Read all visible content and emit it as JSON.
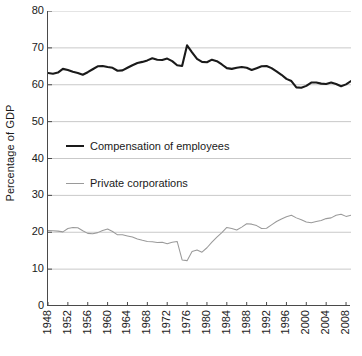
{
  "chart_data": {
    "type": "line",
    "title": "",
    "xlabel": "",
    "ylabel": "Percentage of GDP",
    "xlim": [
      1948,
      2009
    ],
    "ylim": [
      0,
      80
    ],
    "ytick_values": [
      0,
      10,
      20,
      30,
      40,
      50,
      60,
      70,
      80
    ],
    "ytick_labels": [
      "0",
      "10",
      "20",
      "30",
      "40",
      "50",
      "60",
      "70",
      "80"
    ],
    "xtick_values": [
      1948,
      1952,
      1956,
      1960,
      1964,
      1968,
      1972,
      1976,
      1980,
      1984,
      1988,
      1992,
      1996,
      2000,
      2004,
      2008
    ],
    "xtick_labels": [
      "1948",
      "1952",
      "1956",
      "1960",
      "1964",
      "1968",
      "1972",
      "1976",
      "1980",
      "1984",
      "1988",
      "1992",
      "1996",
      "2000",
      "2004",
      "2008"
    ],
    "grid": "horizontal",
    "legend_position": "inside-upper-left",
    "colors": {
      "series_0": "#1a1a1a",
      "series_1": "#9a9a9a",
      "grid": "#c9c9c9",
      "axis": "#4a4a4a"
    },
    "x": [
      1948,
      1949,
      1950,
      1951,
      1952,
      1953,
      1954,
      1955,
      1956,
      1957,
      1958,
      1959,
      1960,
      1961,
      1962,
      1963,
      1964,
      1965,
      1966,
      1967,
      1968,
      1969,
      1970,
      1971,
      1972,
      1973,
      1974,
      1975,
      1976,
      1977,
      1978,
      1979,
      1980,
      1981,
      1982,
      1983,
      1984,
      1985,
      1986,
      1987,
      1988,
      1989,
      1990,
      1991,
      1992,
      1993,
      1994,
      1995,
      1996,
      1997,
      1998,
      1999,
      2000,
      2001,
      2002,
      2003,
      2004,
      2005,
      2006,
      2007,
      2008,
      2009
    ],
    "series": [
      {
        "name": "Compensation of employees",
        "style": "thick-solid",
        "color": "#1a1a1a",
        "values": [
          63.2,
          63.0,
          63.3,
          64.3,
          64.0,
          63.5,
          63.2,
          62.7,
          63.4,
          64.2,
          65.0,
          65.1,
          64.8,
          64.6,
          63.8,
          63.9,
          64.6,
          65.3,
          65.9,
          66.2,
          66.6,
          67.2,
          66.8,
          66.7,
          67.1,
          66.4,
          65.3,
          65.1,
          70.7,
          68.8,
          67.0,
          66.2,
          66.1,
          66.8,
          66.4,
          65.5,
          64.5,
          64.3,
          64.6,
          64.8,
          64.6,
          64.0,
          64.5,
          65.0,
          65.1,
          64.5,
          63.6,
          62.7,
          61.6,
          61.0,
          59.3,
          59.2,
          59.7,
          60.6,
          60.6,
          60.3,
          60.2,
          60.6,
          60.2,
          59.6,
          60.1,
          61.0
        ]
      },
      {
        "name": "Private corporations",
        "style": "thin-solid",
        "color": "#9a9a9a",
        "values": [
          20.5,
          20.4,
          20.3,
          20.1,
          21.0,
          21.3,
          21.2,
          20.4,
          19.7,
          19.6,
          19.9,
          20.5,
          20.9,
          20.2,
          19.3,
          19.3,
          19.0,
          18.7,
          18.2,
          17.8,
          17.5,
          17.4,
          17.2,
          17.3,
          16.9,
          17.3,
          17.5,
          12.5,
          12.3,
          14.8,
          15.2,
          14.6,
          15.8,
          17.3,
          18.7,
          19.9,
          21.3,
          21.0,
          20.6,
          21.4,
          22.3,
          22.2,
          21.8,
          21.0,
          21.1,
          22.0,
          22.9,
          23.6,
          24.2,
          24.6,
          23.9,
          23.4,
          22.8,
          22.6,
          22.9,
          23.2,
          23.7,
          23.9,
          24.6,
          24.9,
          24.3,
          24.6
        ]
      }
    ]
  }
}
